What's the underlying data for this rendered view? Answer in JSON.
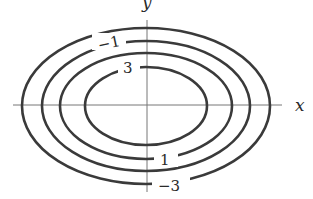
{
  "diagram": {
    "type": "contour-plot",
    "axes": {
      "x_label": "x",
      "y_label": "y"
    },
    "contours": [
      {
        "level": 3,
        "label": "3"
      },
      {
        "level": 1,
        "label": "1"
      },
      {
        "level": -1,
        "label": "−1"
      },
      {
        "level": -3,
        "label": "−3"
      }
    ]
  }
}
